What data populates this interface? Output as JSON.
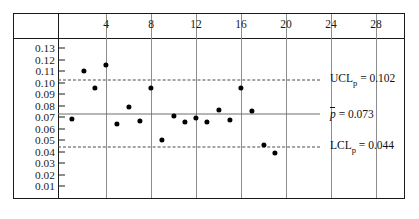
{
  "chart_data": {
    "type": "scatter",
    "title": "",
    "subtitle": "",
    "xlabel": "",
    "ylabel": "",
    "x": [
      1,
      2,
      3,
      4,
      5,
      6,
      7,
      8,
      9,
      10,
      11,
      12,
      13,
      14,
      15,
      16,
      17,
      18,
      19
    ],
    "values": [
      0.068,
      0.11,
      0.0955,
      0.1155,
      0.064,
      0.0785,
      0.0665,
      0.0955,
      0.05,
      0.071,
      0.0655,
      0.0695,
      0.066,
      0.076,
      0.0675,
      0.0955,
      0.0755,
      0.046,
      0.039
    ],
    "series": [
      {
        "name": "fraction nonconforming",
        "values": [
          0.068,
          0.11,
          0.0955,
          0.1155,
          0.064,
          0.0785,
          0.0665,
          0.0955,
          0.05,
          0.071,
          0.0655,
          0.0695,
          0.066,
          0.076,
          0.0675,
          0.0955,
          0.0755,
          0.046,
          0.039
        ]
      }
    ],
    "xlim": [
      0,
      30
    ],
    "ylim": [
      0,
      0.14
    ],
    "xticks": [
      4,
      8,
      12,
      16,
      20,
      24,
      28
    ],
    "xtick_labels": [
      "4",
      "8",
      "12",
      "16",
      "20",
      "24",
      "28"
    ],
    "yticks": [
      0.13,
      0.12,
      0.11,
      0.1,
      0.09,
      0.08,
      0.07,
      0.06,
      0.05,
      0.04,
      0.03,
      0.02,
      0.01
    ],
    "ytick_labels": [
      "0.13",
      "0.12",
      "0.11",
      "0.10",
      "0.09",
      "0.08",
      "0.07",
      "0.06",
      "0.05",
      "0.04",
      "0.03",
      "0.02",
      "0.01"
    ],
    "grid": true,
    "legend": "none",
    "control_limits": [
      {
        "key": "ucl",
        "value": 0.102,
        "style": "dashed",
        "label_prefix": "UCL",
        "label_sub": "p",
        "label_value": "= 0.102"
      },
      {
        "key": "center",
        "value": 0.073,
        "style": "solid",
        "label_prefix": "p̄",
        "label_sub": "",
        "label_value": "= 0.073"
      },
      {
        "key": "lcl",
        "value": 0.044,
        "style": "dashed",
        "label_prefix": "LCL",
        "label_sub": "p",
        "label_value": "= 0.044"
      }
    ],
    "annotations": [
      {
        "text": "UCL",
        "sub": "p",
        "rest": " = 0.102",
        "at_value": 0.102
      },
      {
        "text": "p̄",
        "sub": "",
        "rest": " = 0.073",
        "at_value": 0.073
      },
      {
        "text": "LCL",
        "sub": "p",
        "rest": " = 0.044",
        "at_value": 0.044
      }
    ]
  },
  "labels": {
    "ucl_name": "UCL",
    "ucl_sub": "p",
    "ucl_eq": "= 0.102",
    "center_name": "p",
    "center_eq": "= 0.073",
    "lcl_name": "LCL",
    "lcl_sub": "p",
    "lcl_eq": "= 0.044"
  }
}
